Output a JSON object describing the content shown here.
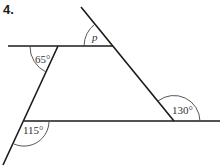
{
  "question_number": "4.",
  "angles": {
    "top_left": "65°",
    "top_right": "p",
    "bottom_right": "130°",
    "bottom_left": "115°"
  },
  "colors": {
    "line": "#1a1a1a",
    "arc": "#444444"
  }
}
